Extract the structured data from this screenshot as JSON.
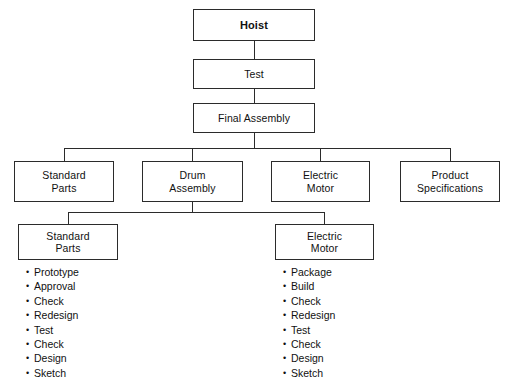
{
  "diagram": {
    "background_color": "#ffffff",
    "line_color": "#2b2b2b",
    "text_color": "#111111",
    "levels": [
      {
        "level": 1,
        "nodes": [
          {
            "id": "hoist",
            "label": "Hoist",
            "bold": true
          }
        ]
      },
      {
        "level": 2,
        "nodes": [
          {
            "id": "test",
            "label": "Test",
            "bold": false
          }
        ]
      },
      {
        "level": 3,
        "nodes": [
          {
            "id": "final-assembly",
            "label": "Final Assembly",
            "bold": false
          }
        ]
      },
      {
        "level": 4,
        "nodes": [
          {
            "id": "standard-parts",
            "label": "Standard\nParts",
            "bold": false
          },
          {
            "id": "drum-assembly",
            "label": "Drum\nAssembly",
            "bold": false
          },
          {
            "id": "electric-motor",
            "label": "Electric\nMotor",
            "bold": false
          },
          {
            "id": "product-specifications",
            "label": "Product\nSpecifications",
            "bold": false
          }
        ]
      },
      {
        "level": 5,
        "nodes": [
          {
            "id": "standard-parts-2",
            "label": "Standard\nParts",
            "bold": false
          },
          {
            "id": "electric-motor-2",
            "label": "Electric\nMotor",
            "bold": false
          }
        ]
      }
    ],
    "lists": [
      {
        "id": "standard-parts-tasks",
        "parent": "standard-parts-2",
        "items": [
          "Prototype",
          "Approval",
          "Check",
          "Redesign",
          "Test",
          "Check",
          "Design",
          "Sketch"
        ]
      },
      {
        "id": "electric-motor-tasks",
        "parent": "electric-motor-2",
        "items": [
          "Package",
          "Build",
          "Check",
          "Redesign",
          "Test",
          "Check",
          "Design",
          "Sketch"
        ]
      }
    ]
  }
}
